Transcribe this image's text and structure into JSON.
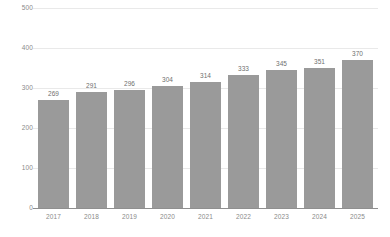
{
  "chart_data": {
    "type": "bar",
    "title": "",
    "subtitle": "",
    "xlabel": "",
    "ylabel": "",
    "categories": [
      "2017",
      "2018",
      "2019",
      "2020",
      "2021",
      "2022",
      "2023",
      "2024",
      "2025"
    ],
    "values": [
      269,
      291,
      296,
      304,
      314,
      333,
      345,
      351,
      370
    ],
    "value_labels": [
      "269",
      "291",
      "296",
      "304",
      "314",
      "333",
      "345",
      "351",
      "370"
    ],
    "ylim": [
      0,
      500
    ],
    "yticks": [
      0,
      100,
      200,
      300,
      400,
      500
    ],
    "ytick_labels": [
      "0",
      "100",
      "200",
      "300",
      "400",
      "500"
    ],
    "grid": true,
    "legend": false,
    "legend_position": "none",
    "data_labels": true,
    "colors": {
      "bar": "#9a9a9a",
      "gridline": "#e9e9e9",
      "baseline": "#8f8f8f",
      "tick_text": "#8a8a8a",
      "value_text": "#6f6f6f",
      "background": "#ffffff"
    }
  }
}
